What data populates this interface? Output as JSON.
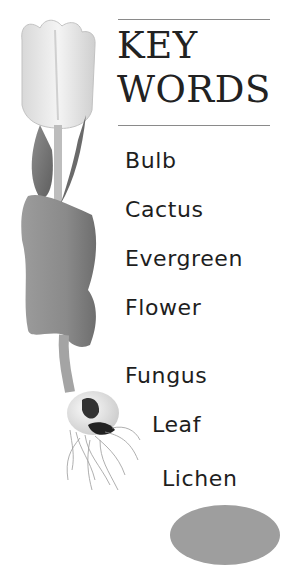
{
  "heading": {
    "line1": "KEY",
    "line2": "WORDS"
  },
  "key_words": [
    {
      "label": "Bulb"
    },
    {
      "label": "Cactus"
    },
    {
      "label": "Evergreen"
    },
    {
      "label": "Flower"
    },
    {
      "label": "Fungus"
    },
    {
      "label": "Leaf"
    },
    {
      "label": "Lichen"
    }
  ],
  "illustration": {
    "subject": "tulip-with-bulb-and-roots",
    "style": "grayscale-photo"
  },
  "colors": {
    "rule": "#8a8a8a",
    "text": "#1e1e1e",
    "bottom_shape": "#9e9e9e"
  }
}
